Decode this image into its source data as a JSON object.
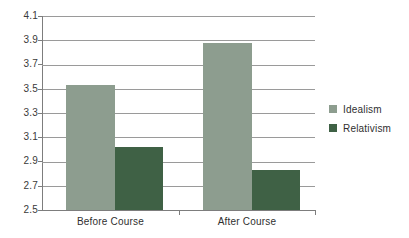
{
  "chart_data": {
    "type": "bar",
    "title": "",
    "xlabel": "",
    "ylabel": "",
    "categories": [
      "Before Course",
      "After Course"
    ],
    "series": [
      {
        "name": "Idealism",
        "values": [
          3.53,
          3.88
        ],
        "color": "#8d9d8f"
      },
      {
        "name": "Relativism",
        "values": [
          3.02,
          2.83
        ],
        "color": "#3f6145"
      }
    ],
    "ylim": [
      2.5,
      4.1
    ],
    "ytick_step": 0.2,
    "yticks": [
      "4.1",
      "3.9",
      "3.7",
      "3.5",
      "3.3",
      "3.1",
      "2.9",
      "2.7",
      "2.5"
    ],
    "grid": true,
    "legend_position": "right"
  },
  "legend": {
    "items": [
      {
        "label": "Idealism",
        "color": "#8d9d8f"
      },
      {
        "label": "Relativism",
        "color": "#3f6145"
      }
    ]
  },
  "axis": {
    "y_tick_labels": [
      "4.1",
      "3.9",
      "3.7",
      "3.5",
      "3.3",
      "3.1",
      "2.9",
      "2.7",
      "2.5"
    ],
    "x_tick_labels": [
      "Before Course",
      "After Course"
    ]
  },
  "colors": {
    "idealism": "#8d9d8f",
    "relativism": "#3f6145",
    "gridline": "#9a9a9a",
    "axis": "#7d7d7d",
    "text": "#2f2f2f",
    "background": "#ffffff"
  }
}
